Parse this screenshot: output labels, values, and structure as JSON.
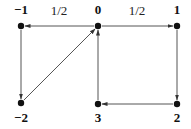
{
  "diagram": {
    "type": "directed-graph",
    "nodes": [
      {
        "id": "n-1",
        "label": "−1",
        "x": 21,
        "y": 26,
        "label_x": 21,
        "label_y": 14
      },
      {
        "id": "n0",
        "label": "0",
        "x": 98,
        "y": 26,
        "label_x": 98,
        "label_y": 14
      },
      {
        "id": "n1",
        "label": "1",
        "x": 177,
        "y": 26,
        "label_x": 177,
        "label_y": 14
      },
      {
        "id": "n-2",
        "label": "−2",
        "x": 21,
        "y": 103,
        "label_x": 21,
        "label_y": 122
      },
      {
        "id": "n3",
        "label": "3",
        "x": 98,
        "y": 104,
        "label_x": 98,
        "label_y": 122
      },
      {
        "id": "n2",
        "label": "2",
        "x": 177,
        "y": 104,
        "label_x": 177,
        "label_y": 122
      }
    ],
    "edges": [
      {
        "from": "n0",
        "to": "n-1",
        "label": "1/2",
        "label_x": 59,
        "label_y": 15
      },
      {
        "from": "n0",
        "to": "n1",
        "label": "1/2",
        "label_x": 137,
        "label_y": 15
      },
      {
        "from": "n-1",
        "to": "n-2",
        "label": ""
      },
      {
        "from": "n-2",
        "to": "n0",
        "label": ""
      },
      {
        "from": "n3",
        "to": "n0",
        "label": ""
      },
      {
        "from": "n1",
        "to": "n2",
        "label": ""
      },
      {
        "from": "n2",
        "to": "n3",
        "label": ""
      }
    ],
    "colors": {
      "line": "#555555",
      "node": "#111111",
      "text": "#111111"
    }
  }
}
